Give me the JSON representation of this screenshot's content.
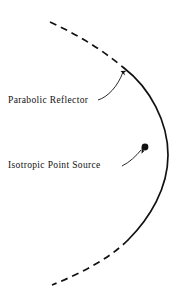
{
  "figure": {
    "background_color": "#ffffff",
    "ink_color": "#111111",
    "labels": {
      "reflector": "Parabolic Reflector",
      "source": "Isotropic Point Source"
    },
    "annotations": {
      "reflector_label_position": {
        "x": 8,
        "y": 103
      },
      "source_label_position": {
        "x": 8,
        "y": 168
      },
      "focus_point": {
        "x": 145,
        "y": 147
      },
      "vertex_point": {
        "x": 168,
        "y": 155
      }
    },
    "curve": {
      "type": "parabola",
      "orientation": "opens-left",
      "solid_segment_y_range": [
        72,
        237
      ],
      "dashed_segment_upper_y_range": [
        22,
        72
      ],
      "dashed_segment_lower_y_range": [
        237,
        285
      ],
      "stroke_width": 1.6,
      "dash_pattern": "7 5"
    },
    "leaders": [
      {
        "name": "reflector-leader",
        "from": {
          "x": 99,
          "y": 99
        },
        "to": {
          "x": 124,
          "y": 68
        },
        "arrow": true
      },
      {
        "name": "source-leader",
        "from": {
          "x": 124,
          "y": 165
        },
        "to": {
          "x": 143,
          "y": 149
        },
        "arrow": true
      }
    ]
  }
}
